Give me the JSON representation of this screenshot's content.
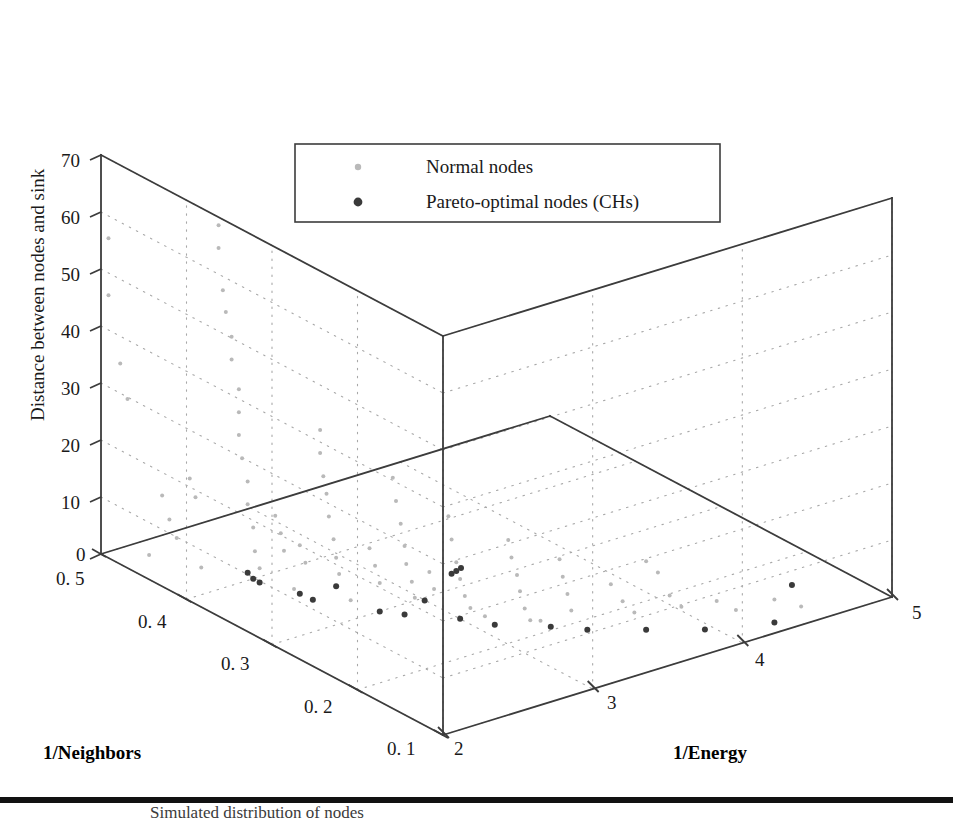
{
  "chart_data": {
    "type": "scatter",
    "title": "",
    "subtitle": "",
    "projection": "3d",
    "xlabel": "1/Neighbors",
    "ylabel": "1/Energy",
    "zlabel": "Distance between nodes and sink",
    "grid": true,
    "legend_position": "top-center",
    "axes": {
      "neighbors": {
        "label": "1/Neighbors",
        "ticks": [
          "0.5",
          "0.4",
          "0.3",
          "0.2",
          "0.1"
        ],
        "range": [
          0.5,
          0.1
        ]
      },
      "energy": {
        "label": "1/Energy",
        "ticks": [
          "2",
          "3",
          "4",
          "5"
        ],
        "range": [
          2,
          5
        ]
      },
      "distance": {
        "label": "Distance between nodes and sink",
        "ticks": [
          "0",
          "10",
          "20",
          "30",
          "40",
          "50",
          "60",
          "70"
        ],
        "range": [
          0,
          70
        ]
      }
    },
    "series": [
      {
        "name": "Normal nodes",
        "marker": "circle",
        "color": "#b9b9b9",
        "size": 4,
        "points": [
          [
            0.5,
            2.05,
            55
          ],
          [
            0.5,
            2.05,
            45
          ],
          [
            0.495,
            2.1,
            33
          ],
          [
            0.49,
            2.12,
            27
          ],
          [
            0.415,
            2.3,
            62
          ],
          [
            0.415,
            2.3,
            58
          ],
          [
            0.41,
            2.3,
            51
          ],
          [
            0.41,
            2.32,
            47
          ],
          [
            0.405,
            2.33,
            43
          ],
          [
            0.405,
            2.33,
            39
          ],
          [
            0.4,
            2.35,
            34
          ],
          [
            0.4,
            2.35,
            30
          ],
          [
            0.4,
            2.35,
            26
          ],
          [
            0.398,
            2.36,
            22
          ],
          [
            0.395,
            2.38,
            18
          ],
          [
            0.395,
            2.38,
            14
          ],
          [
            0.392,
            2.4,
            10
          ],
          [
            0.39,
            2.4,
            6
          ],
          [
            0.388,
            2.42,
            3
          ],
          [
            0.34,
            2.55,
            30
          ],
          [
            0.34,
            2.55,
            26
          ],
          [
            0.338,
            2.56,
            22
          ],
          [
            0.336,
            2.57,
            19
          ],
          [
            0.335,
            2.58,
            15
          ],
          [
            0.333,
            2.6,
            11
          ],
          [
            0.33,
            2.6,
            8
          ],
          [
            0.33,
            2.62,
            5
          ],
          [
            0.29,
            2.75,
            24
          ],
          [
            0.288,
            2.76,
            20
          ],
          [
            0.286,
            2.78,
            16
          ],
          [
            0.285,
            2.8,
            12
          ],
          [
            0.283,
            2.8,
            9
          ],
          [
            0.28,
            2.82,
            6
          ],
          [
            0.28,
            2.84,
            3
          ],
          [
            0.26,
            2.95,
            18
          ],
          [
            0.258,
            2.96,
            14
          ],
          [
            0.256,
            2.98,
            10
          ],
          [
            0.255,
            3.0,
            7
          ],
          [
            0.253,
            3.02,
            4
          ],
          [
            0.25,
            3.04,
            2
          ],
          [
            0.225,
            3.15,
            15
          ],
          [
            0.223,
            3.16,
            12
          ],
          [
            0.22,
            3.18,
            9
          ],
          [
            0.22,
            3.2,
            6
          ],
          [
            0.218,
            3.22,
            3
          ],
          [
            0.215,
            3.24,
            1
          ],
          [
            0.2,
            3.35,
            12
          ],
          [
            0.198,
            3.36,
            9
          ],
          [
            0.196,
            3.38,
            6
          ],
          [
            0.195,
            3.4,
            3
          ],
          [
            0.46,
            2.18,
            12
          ],
          [
            0.455,
            2.2,
            8
          ],
          [
            0.45,
            2.22,
            5
          ],
          [
            0.44,
            2.25,
            16
          ],
          [
            0.435,
            2.26,
            13
          ],
          [
            0.375,
            2.45,
            13
          ],
          [
            0.372,
            2.47,
            10
          ],
          [
            0.37,
            2.48,
            7
          ],
          [
            0.355,
            2.5,
            9
          ],
          [
            0.352,
            2.52,
            6
          ],
          [
            0.305,
            2.68,
            11
          ],
          [
            0.302,
            2.7,
            8
          ],
          [
            0.3,
            2.72,
            5
          ],
          [
            0.27,
            2.88,
            8
          ],
          [
            0.268,
            2.9,
            5
          ],
          [
            0.175,
            3.55,
            8
          ],
          [
            0.17,
            3.6,
            5
          ],
          [
            0.165,
            3.65,
            3
          ],
          [
            0.15,
            3.8,
            6
          ],
          [
            0.145,
            3.85,
            4
          ],
          [
            0.13,
            4.0,
            5
          ],
          [
            0.125,
            4.1,
            3
          ],
          [
            0.115,
            4.3,
            4
          ],
          [
            0.11,
            4.45,
            2
          ],
          [
            0.21,
            3.28,
            1
          ],
          [
            0.24,
            3.08,
            1
          ],
          [
            0.32,
            2.64,
            1
          ],
          [
            0.36,
            2.49,
            1
          ],
          [
            0.43,
            2.27,
            1
          ],
          [
            0.47,
            2.15,
            1
          ],
          [
            0.16,
            3.7,
            12
          ],
          [
            0.155,
            3.75,
            10
          ]
        ]
      },
      {
        "name": "Pareto-optimal nodes (CHs)",
        "marker": "circle",
        "color": "#3a3a3a",
        "size": 6,
        "points": [
          [
            0.395,
            2.38,
            2
          ],
          [
            0.392,
            2.4,
            1
          ],
          [
            0.388,
            2.42,
            0.5
          ],
          [
            0.355,
            2.5,
            0.5
          ],
          [
            0.345,
            2.53,
            0
          ],
          [
            0.3,
            2.72,
            0
          ],
          [
            0.285,
            2.8,
            0
          ],
          [
            0.255,
            3.0,
            0
          ],
          [
            0.232,
            3.1,
            0
          ],
          [
            0.205,
            3.32,
            0
          ],
          [
            0.185,
            3.45,
            0
          ],
          [
            0.16,
            3.7,
            0
          ],
          [
            0.135,
            3.95,
            0
          ],
          [
            0.115,
            4.3,
            0
          ],
          [
            0.112,
            4.4,
            6
          ],
          [
            0.33,
            2.6,
            3
          ],
          [
            0.272,
            2.86,
            3
          ],
          [
            0.258,
            2.96,
            8
          ],
          [
            0.256,
            2.98,
            8.5
          ],
          [
            0.254,
            3.0,
            9
          ]
        ]
      }
    ],
    "legend": [
      {
        "label": "Normal nodes",
        "color": "#b9b9b9",
        "marker": "dot-small"
      },
      {
        "label": "Pareto-optimal nodes (CHs)",
        "color": "#3a3a3a",
        "marker": "dot-large"
      }
    ]
  },
  "axis_ticks": {
    "distance": [
      "70",
      "60",
      "50",
      "40",
      "30",
      "20",
      "10",
      "0"
    ],
    "neighbors": [
      "0. 5",
      "0. 4",
      "0. 3",
      "0. 2",
      "0. 1"
    ],
    "energy": [
      "2",
      "3",
      "4",
      "5"
    ]
  },
  "axis_titles": {
    "distance": "Distance between nodes and sink",
    "neighbors": "1/Neighbors",
    "energy": "1/Energy"
  },
  "legend": {
    "normal_nodes": "Normal nodes",
    "pareto_nodes": "Pareto-optimal nodes (CHs)"
  },
  "colors": {
    "normal": "#b9b9b9",
    "pareto": "#3a3a3a",
    "frame": "#3c3c3c",
    "grid": "#a8a8a8",
    "background": "#ffffff",
    "rule": "#111111"
  },
  "caption": {
    "text": "Simulated distribution of nodes"
  }
}
